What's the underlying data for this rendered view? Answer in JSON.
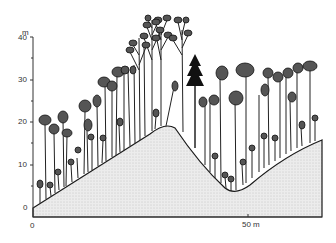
{
  "diagram": {
    "y_axis": {
      "unit": "m",
      "ticks": [
        "40",
        "30",
        "20",
        "10",
        "0"
      ]
    },
    "x_axis": {
      "ticks": [
        "0",
        "50 m"
      ]
    },
    "colors": {
      "ink": "#1a1a1a",
      "ground_fill": "#e6e6e6"
    }
  }
}
